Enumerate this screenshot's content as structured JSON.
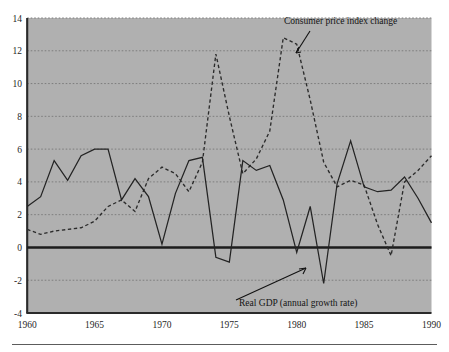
{
  "chart_data": {
    "type": "line",
    "title": "",
    "xlabel": "",
    "ylabel": "",
    "xlim": [
      1960,
      1990
    ],
    "ylim": [
      -4,
      14
    ],
    "ytick_step": 2,
    "grid": true,
    "legend_position": "inline-annotations",
    "xticks": [
      1960,
      1965,
      1970,
      1975,
      1980,
      1985,
      1990
    ],
    "xtick_labels": [
      "1960",
      "1965",
      "1970",
      "1975",
      "1980",
      "1985",
      "1990"
    ],
    "yticks": [
      -4,
      -2,
      0,
      2,
      4,
      6,
      8,
      10,
      12,
      14
    ],
    "ytick_labels": [
      "-4",
      "-2",
      "0",
      "2",
      "4",
      "6",
      "8",
      "10",
      "12",
      "14"
    ],
    "x": [
      1960,
      1961,
      1962,
      1963,
      1964,
      1965,
      1966,
      1967,
      1968,
      1969,
      1970,
      1971,
      1972,
      1973,
      1974,
      1975,
      1976,
      1977,
      1978,
      1979,
      1980,
      1981,
      1982,
      1983,
      1984,
      1985,
      1986,
      1987,
      1988,
      1989,
      1990
    ],
    "series": [
      {
        "name": "Real GDP (annual growth rate)",
        "style": "solid",
        "color": "#232323",
        "values": [
          2.5,
          3.1,
          5.3,
          4.1,
          5.6,
          6.0,
          6.0,
          2.9,
          4.2,
          3.1,
          0.2,
          3.3,
          5.3,
          5.5,
          -0.6,
          -0.9,
          5.3,
          4.7,
          5.0,
          2.9,
          -0.3,
          2.5,
          -2.2,
          3.9,
          6.5,
          3.7,
          3.4,
          3.5,
          4.3,
          3.0,
          1.5
        ]
      },
      {
        "name": "Consumer price index change",
        "style": "dashed",
        "color": "#2b2b2b",
        "values": [
          1.1,
          0.8,
          1.0,
          1.1,
          1.2,
          1.6,
          2.5,
          2.9,
          2.2,
          4.2,
          4.9,
          4.5,
          3.4,
          5.2,
          11.8,
          8.0,
          4.5,
          5.4,
          7.1,
          12.8,
          12.4,
          9.0,
          5.2,
          3.7,
          4.1,
          3.8,
          1.4,
          -0.5,
          4.0,
          4.7,
          5.6
        ]
      }
    ],
    "annotations": [
      {
        "name": "cpi-annotation",
        "text": "Consumer price index change"
      },
      {
        "name": "gdp-annotation",
        "text": "Real GDP (annual growth rate)"
      }
    ]
  },
  "colors": {
    "plot_background": "#b0b0b0",
    "page_background": "#ffffff",
    "axis": "#2a2a2a",
    "gridline": "#7d7d7d",
    "gdp_line": "#232323",
    "cpi_line": "#2b2b2b"
  }
}
